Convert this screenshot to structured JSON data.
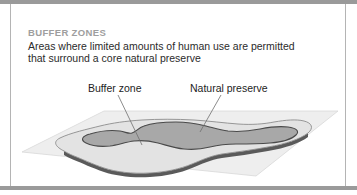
{
  "figure": {
    "kicker": "BUFFER ZONES",
    "body_line_1": "Areas where limited amounts of human use are permitted",
    "body_line_2": "that surround a core natural preserve",
    "callouts": {
      "buffer": "Buffer zone",
      "preserve": "Natural preserve"
    }
  },
  "colors": {
    "frame_bar": "#9a9a9a",
    "frame_rule": "#b4b4b4",
    "kicker_text": "#9e9e9e",
    "body_text": "#2b2b2b",
    "callout_text": "#1d1d1d",
    "ground_plane": "#eeeeee",
    "ground_plane_edge": "#d8d8d8",
    "island_top": "#e3e3e3",
    "island_side": "#5a5a5a",
    "island_outline": "#8c8c8c",
    "preserve_fill": "#a8a8a8",
    "preserve_outline": "#4a4a4a",
    "leader_line": "#6e6e6e",
    "background": "#ffffff"
  },
  "art": {
    "ground_plane_points": "22,152 104,111 338,111 256,176",
    "island_top_path": "M 64,151 C 56,147 52,142 60,138 C 70,133 88,129 100,126 C 112,123 126,121 142,120 C 158,119 176,119 194,120 C 210,121 224,123 238,124 C 252,125 264,124 274,122 C 286,120 296,119 304,121 C 312,123 314,128 308,133 C 300,139 286,144 268,147 C 252,150 236,152 222,154 C 210,156 202,160 192,164 C 180,169 166,172 150,173 C 132,174 116,172 104,168 C 92,164 82,159 74,156 C 69,154 66,152 64,151 Z",
    "island_side_path": "M 64,151 C 66,152 69,154 74,156 C 82,159 92,164 104,168 C 116,172 132,174 150,173 C 166,172 180,169 192,164 C 202,160 210,156 222,154 C 236,152 252,150 268,147 C 286,144 300,139 308,133 L 308,137 C 300,143 286,148 268,151 C 252,154 236,156 222,158 C 210,160 202,164 192,168 C 180,173 166,176 150,177 C 132,178 116,176 104,172 C 92,168 82,163 74,160 C 69,158 66,156 64,155 Z",
    "preserve_path": "M 86,143 C 80,140 82,136 90,134 C 100,131 112,130 120,131 C 126,132 128,134 132,133 C 136,132 138,128 144,126 C 152,123 164,122 176,122 C 188,122 198,124 206,126 C 214,128 220,130 228,131 C 238,132 250,131 260,129 C 270,127 280,126 288,127 C 296,128 300,131 296,135 C 292,139 282,142 270,143 C 258,144 246,144 236,144 C 226,144 218,145 210,147 C 202,149 194,150 184,149 C 174,148 166,145 158,143 C 150,141 142,140 134,141 C 126,142 118,145 110,146 C 100,147 92,146 86,143 Z",
    "leader_buffer": "118,95 L 142,145",
    "leader_preserve": "221,95 L 200,132"
  }
}
